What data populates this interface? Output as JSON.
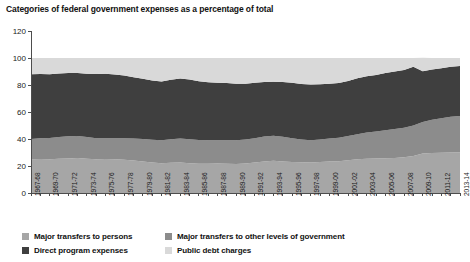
{
  "chart_data": {
    "type": "area",
    "title": "Categories of federal government expenses as a percentage of total",
    "xlabel": "",
    "ylabel": "",
    "ylim": [
      0,
      120
    ],
    "yticks": [
      0,
      20,
      40,
      60,
      80,
      100,
      120
    ],
    "grid": false,
    "legend_position": "bottom",
    "stacked": true,
    "x": [
      "1967-68",
      "1968-69",
      "1969-70",
      "1970-71",
      "1971-72",
      "1972-73",
      "1973-74",
      "1974-75",
      "1975-76",
      "1976-77",
      "1977-78",
      "1978-79",
      "1979-80",
      "1980-81",
      "1981-82",
      "1982-83",
      "1983-84",
      "1984-85",
      "1985-86",
      "1986-87",
      "1987-88",
      "1988-89",
      "1989-90",
      "1990-91",
      "1991-92",
      "1992-93",
      "1993-94",
      "1994-95",
      "1995-96",
      "1996-97",
      "1997-98",
      "1998-99",
      "1999-00",
      "2000-01",
      "2001-02",
      "2002-03",
      "2003-04",
      "2004-05",
      "2005-06",
      "2006-07",
      "2007-08",
      "2008-09",
      "2009-10",
      "2010-11",
      "2011-12",
      "2012-13",
      "2013-14"
    ],
    "xtick_labels": [
      "1967-68",
      "1969-70",
      "1971-72",
      "1973-74",
      "1975-76",
      "1977-78",
      "1979-80",
      "1981-82",
      "1983-84",
      "1985-86",
      "1987-88",
      "1989-90",
      "1991-92",
      "1993-94",
      "1995-96",
      "1997-98",
      "1999-00",
      "2001-02",
      "2003-04",
      "2005-06",
      "2007-08",
      "2009-10",
      "2011-12",
      "2013-14"
    ],
    "series": [
      {
        "name": "Major transfers to persons",
        "color": "#a6a6a6",
        "values": [
          25.0,
          25.2,
          25.0,
          25.3,
          25.6,
          26.0,
          25.4,
          25.0,
          25.2,
          25.0,
          24.6,
          24.0,
          23.4,
          22.6,
          22.0,
          22.4,
          22.6,
          22.0,
          21.6,
          21.6,
          21.8,
          21.6,
          21.4,
          21.8,
          22.6,
          23.4,
          23.8,
          23.4,
          23.0,
          22.8,
          22.6,
          23.0,
          23.4,
          23.6,
          24.2,
          25.0,
          25.4,
          25.6,
          25.8,
          26.0,
          26.4,
          27.4,
          29.2,
          29.6,
          29.8,
          30.0,
          30.2
        ]
      },
      {
        "name": "Major transfers to other levels of government",
        "color": "#8c8c8c",
        "values": [
          15.0,
          15.4,
          15.8,
          16.2,
          16.4,
          16.2,
          16.0,
          15.6,
          15.4,
          15.6,
          16.0,
          16.4,
          16.6,
          16.8,
          17.0,
          17.4,
          17.8,
          17.8,
          17.6,
          17.4,
          17.2,
          17.4,
          17.6,
          17.8,
          18.0,
          18.4,
          18.6,
          18.2,
          17.6,
          16.8,
          16.4,
          16.6,
          17.0,
          17.4,
          18.0,
          18.6,
          19.4,
          20.0,
          20.6,
          21.4,
          22.0,
          22.6,
          23.4,
          24.6,
          25.6,
          26.4,
          26.8
        ]
      },
      {
        "name": "Direct program expenses",
        "color": "#3f3f3f",
        "values": [
          48.0,
          47.6,
          47.2,
          47.0,
          46.8,
          46.6,
          47.0,
          47.6,
          47.8,
          47.2,
          46.4,
          45.4,
          44.6,
          44.0,
          43.6,
          44.0,
          44.4,
          44.2,
          43.6,
          43.0,
          42.6,
          42.4,
          42.0,
          41.4,
          41.0,
          40.4,
          40.0,
          40.6,
          41.0,
          41.2,
          41.4,
          41.0,
          40.6,
          40.4,
          40.8,
          41.4,
          41.6,
          41.8,
          42.4,
          42.6,
          42.8,
          43.6,
          37.6,
          37.2,
          37.0,
          37.2,
          37.0
        ]
      },
      {
        "name": "Public debt charges",
        "color": "#d9d9d9",
        "values": [
          12.0,
          11.8,
          12.0,
          11.5,
          11.2,
          11.2,
          11.6,
          11.8,
          11.6,
          12.2,
          13.0,
          14.2,
          15.4,
          16.6,
          17.4,
          16.2,
          15.2,
          16.0,
          17.2,
          18.0,
          18.4,
          18.6,
          19.0,
          19.0,
          18.4,
          17.8,
          17.6,
          17.8,
          18.4,
          19.2,
          19.6,
          19.4,
          19.0,
          18.6,
          17.0,
          15.0,
          13.6,
          12.6,
          11.2,
          10.0,
          8.8,
          6.4,
          10.0,
          8.6,
          7.6,
          6.4,
          6.0
        ]
      }
    ]
  },
  "legend": {
    "items": [
      {
        "label": "Major transfers to persons"
      },
      {
        "label": "Major transfers to other levels of government"
      },
      {
        "label": "Direct program expenses"
      },
      {
        "label": "Public debt charges"
      }
    ]
  }
}
